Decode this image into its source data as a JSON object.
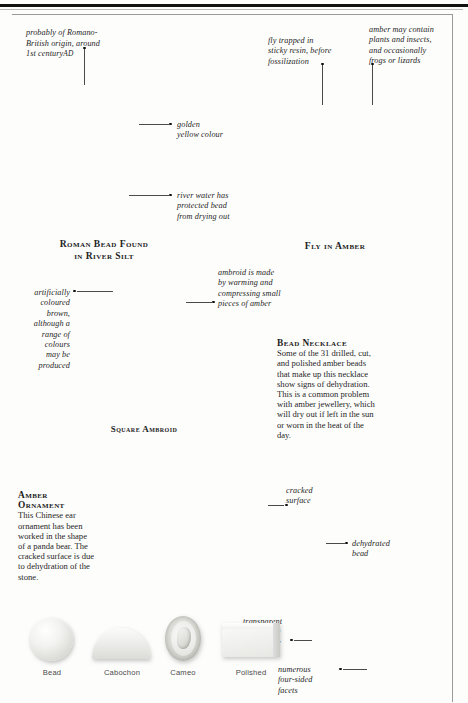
{
  "sections": {
    "roman_bead": {
      "caption_line1": "Roman Bead Found",
      "caption_line2": "in River Silt",
      "annotations": {
        "origin": "probably of Romano-\nBritish origin, around\n1st century",
        "origin_smallcaps": "AD",
        "colour": "golden\nyellow colour",
        "river": "river water has\nprotected bead\nfrom drying out"
      }
    },
    "fly_in_amber": {
      "caption": "Fly in Amber",
      "annotations": {
        "trapped": "fly trapped in\nsticky resin, before\nfossilization",
        "contents": "amber may contain\nplants and insects,\nand occasionally\nfrogs or lizards"
      }
    },
    "square_ambroid": {
      "caption": "Square Ambroid",
      "annotations": {
        "coloured": "artificially\ncoloured\nbrown,\nalthough a\nrange of\ncolours\nmay be\nproduced",
        "made": "ambroid is made\nby warming and\ncompressing small\npieces of amber"
      }
    },
    "bead_necklace": {
      "title": "Bead Necklace",
      "body": "Some of the 31 drilled, cut, and polished amber beads that make up this necklace show signs of dehydration. This is a common problem with amber jewellery, which will dry out if left in the sun or worn in the heat of the day.",
      "annotations": {
        "cracked": "cracked\nsurface",
        "dehydrated": "dehydrated\nbead",
        "transparent": "transparent\nbeads have\nwarm glow",
        "facets": "numerous\nfour-sided\nfacets"
      }
    },
    "amber_ornament": {
      "title_line1": "Amber",
      "title_line2": "Ornament",
      "body": "This Chinese ear ornament has been worked in the shape of a panda bear. The cracked surface is due to dehydration of the stone."
    },
    "specimen_row": {
      "items": [
        {
          "label": "Bead"
        },
        {
          "label": "Cabochon"
        },
        {
          "label": "Cameo"
        },
        {
          "label": "Polished"
        }
      ]
    }
  },
  "colors": {
    "rule": "#111111",
    "frame": "#9a9a9a",
    "text": "#1f1f1f",
    "annotation": "#1d1d1d",
    "background": "#fdfdfc"
  }
}
